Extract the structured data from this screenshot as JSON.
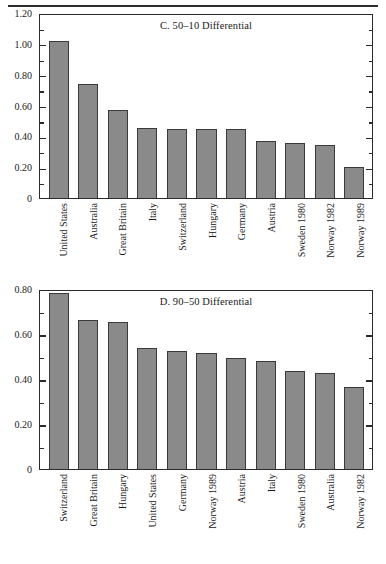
{
  "figure": {
    "background": "#ffffff",
    "bar_fill": "#8a8a8a",
    "bar_stroke": "#3a3a3a",
    "axis_color": "#2b2b2b"
  },
  "chart_data": [
    {
      "type": "bar",
      "title": "C. 50–10 Differential",
      "xlabel": "",
      "ylabel": "",
      "ylim": [
        0,
        1.2
      ],
      "ytick_labels": [
        "0",
        "0.20",
        "0.40",
        "0.60",
        "0.80",
        "1.00",
        "1.20"
      ],
      "ytick_values": [
        0,
        0.2,
        0.4,
        0.6,
        0.8,
        1.0,
        1.2
      ],
      "minor_tick_values": [
        0.1,
        0.3,
        0.5,
        0.7,
        0.9,
        1.1
      ],
      "grid": false,
      "legend": "none",
      "categories": [
        "United States",
        "Australia",
        "Great Britain",
        "Italy",
        "Switzerland",
        "Hungary",
        "Germany",
        "Austria",
        "Sweden 1980",
        "Norway 1982",
        "Norway 1989"
      ],
      "values": [
        1.03,
        0.75,
        0.58,
        0.46,
        0.455,
        0.455,
        0.45,
        0.375,
        0.36,
        0.35,
        0.205
      ]
    },
    {
      "type": "bar",
      "title": "D. 90–50 Differential",
      "xlabel": "",
      "ylabel": "",
      "ylim": [
        0,
        0.8
      ],
      "ytick_labels": [
        "0",
        "0.20",
        "0.40",
        "0.60",
        "0.80"
      ],
      "ytick_values": [
        0,
        0.2,
        0.4,
        0.6,
        0.8
      ],
      "minor_tick_values": [
        0.1,
        0.3,
        0.5,
        0.7
      ],
      "grid": false,
      "legend": "none",
      "categories": [
        "Switzerland",
        "Great Britain",
        "Hungary",
        "United States",
        "Germany",
        "Norway 1989",
        "Austria",
        "Italy",
        "Sweden 1980",
        "Australia",
        "Norway 1982"
      ],
      "values": [
        0.79,
        0.67,
        0.66,
        0.545,
        0.53,
        0.52,
        0.5,
        0.485,
        0.44,
        0.43,
        0.37
      ]
    }
  ]
}
